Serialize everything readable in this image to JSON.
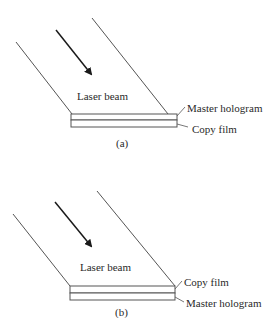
{
  "panels": [
    {
      "id": "a",
      "caption": "(a)",
      "beam_label": "Laser beam",
      "layers": [
        {
          "position": "top",
          "label": "Master hologram"
        },
        {
          "position": "bottom",
          "label": "Copy film"
        }
      ]
    },
    {
      "id": "b",
      "caption": "(b)",
      "beam_label": "Laser beam",
      "layers": [
        {
          "position": "top",
          "label": "Copy film"
        },
        {
          "position": "bottom",
          "label": "Master hologram"
        }
      ]
    }
  ],
  "colors": {
    "line": "#555555",
    "arrow": "#1a1a1a",
    "text": "#2a2a2a"
  }
}
